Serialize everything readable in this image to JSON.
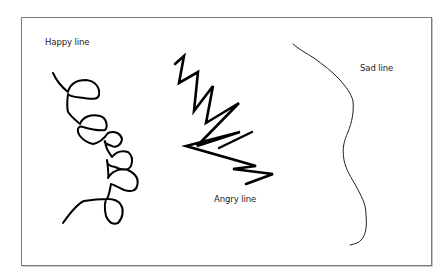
{
  "figure": {
    "labels": {
      "happy": "Happy line",
      "angry": "Angry line",
      "sad": "Sad line"
    },
    "colors": {
      "background": "#ffffff",
      "frame": "#7a7a7a",
      "stroke": "#000000",
      "text": "#1a1a1a"
    }
  }
}
